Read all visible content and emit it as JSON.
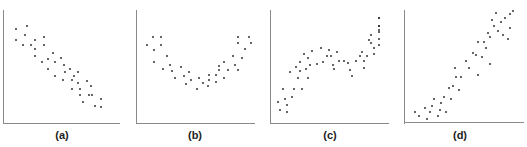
{
  "chart_data": [
    {
      "type": "scatter",
      "title": "(a)",
      "description": "negative linear correlation",
      "xlim": [
        0,
        100
      ],
      "ylim": [
        0,
        100
      ],
      "grid": false,
      "points": [
        [
          10,
          85
        ],
        [
          20,
          88
        ],
        [
          18,
          80
        ],
        [
          10,
          75
        ],
        [
          16,
          70
        ],
        [
          23,
          70
        ],
        [
          27,
          75
        ],
        [
          27,
          67
        ],
        [
          35,
          78
        ],
        [
          35,
          70
        ],
        [
          27,
          60
        ],
        [
          33,
          55
        ],
        [
          38,
          57
        ],
        [
          43,
          63
        ],
        [
          45,
          55
        ],
        [
          50,
          58
        ],
        [
          38,
          48
        ],
        [
          45,
          42
        ],
        [
          53,
          52
        ],
        [
          54,
          45
        ],
        [
          58,
          48
        ],
        [
          62,
          42
        ],
        [
          52,
          38
        ],
        [
          60,
          38
        ],
        [
          65,
          45
        ],
        [
          65,
          35
        ],
        [
          60,
          30
        ],
        [
          67,
          30
        ],
        [
          73,
          37
        ],
        [
          77,
          32
        ],
        [
          67,
          24
        ],
        [
          75,
          24
        ],
        [
          70,
          18
        ],
        [
          78,
          24
        ],
        [
          86,
          20
        ],
        [
          80,
          14
        ],
        [
          86,
          13
        ]
      ]
    },
    {
      "type": "scatter",
      "title": "(b)",
      "description": "U-shaped (quadratic) relationship",
      "xlim": [
        0,
        100
      ],
      "ylim": [
        0,
        100
      ],
      "grid": false,
      "points": [
        [
          5,
          70
        ],
        [
          11,
          78
        ],
        [
          18,
          78
        ],
        [
          12,
          66
        ],
        [
          18,
          70
        ],
        [
          23,
          60
        ],
        [
          12,
          55
        ],
        [
          20,
          48
        ],
        [
          26,
          52
        ],
        [
          28,
          46
        ],
        [
          30,
          40
        ],
        [
          36,
          50
        ],
        [
          38,
          42
        ],
        [
          40,
          34
        ],
        [
          43,
          45
        ],
        [
          45,
          38
        ],
        [
          50,
          30
        ],
        [
          52,
          40
        ],
        [
          55,
          35
        ],
        [
          60,
          32
        ],
        [
          61,
          43
        ],
        [
          61,
          38
        ],
        [
          67,
          43
        ],
        [
          67,
          36
        ],
        [
          70,
          51
        ],
        [
          70,
          47
        ],
        [
          74,
          55
        ],
        [
          74,
          40
        ],
        [
          78,
          47
        ],
        [
          82,
          60
        ],
        [
          84,
          52
        ],
        [
          87,
          47
        ],
        [
          87,
          72
        ],
        [
          87,
          78
        ],
        [
          90,
          58
        ],
        [
          93,
          67
        ],
        [
          96,
          78
        ],
        [
          98,
          72
        ]
      ]
    },
    {
      "type": "scatter",
      "title": "(c)",
      "description": "non-linear increasing wave relationship",
      "xlim": [
        0,
        100
      ],
      "ylim": [
        0,
        100
      ],
      "grid": false,
      "points": [
        [
          3,
          18
        ],
        [
          5,
          10
        ],
        [
          8,
          30
        ],
        [
          10,
          20
        ],
        [
          12,
          15
        ],
        [
          12,
          8
        ],
        [
          14,
          45
        ],
        [
          16,
          22
        ],
        [
          18,
          30
        ],
        [
          20,
          50
        ],
        [
          22,
          40
        ],
        [
          24,
          55
        ],
        [
          24,
          46
        ],
        [
          26,
          30
        ],
        [
          28,
          62
        ],
        [
          30,
          48
        ],
        [
          32,
          58
        ],
        [
          32,
          40
        ],
        [
          34,
          52
        ],
        [
          36,
          65
        ],
        [
          40,
          53
        ],
        [
          44,
          68
        ],
        [
          46,
          55
        ],
        [
          50,
          60
        ],
        [
          52,
          66
        ],
        [
          54,
          60
        ],
        [
          56,
          52
        ],
        [
          57,
          48
        ],
        [
          60,
          64
        ],
        [
          62,
          56
        ],
        [
          66,
          56
        ],
        [
          70,
          54
        ],
        [
          72,
          47
        ],
        [
          74,
          42
        ],
        [
          78,
          56
        ],
        [
          82,
          60
        ],
        [
          84,
          64
        ],
        [
          86,
          49
        ],
        [
          86,
          56
        ],
        [
          88,
          60
        ],
        [
          90,
          75
        ],
        [
          92,
          80
        ],
        [
          92,
          72
        ],
        [
          95,
          68
        ],
        [
          95,
          62
        ],
        [
          100,
          88
        ],
        [
          100,
          82
        ],
        [
          103,
          76
        ],
        [
          103,
          70
        ],
        [
          106,
          95
        ],
        [
          108,
          84
        ],
        [
          110,
          95
        ],
        [
          112,
          88
        ]
      ]
    },
    {
      "type": "scatter",
      "title": "(d)",
      "description": "positive non-linear (exponential/curved) relationship",
      "xlim": [
        0,
        100
      ],
      "ylim": [
        0,
        100
      ],
      "grid": false,
      "points": [
        [
          6,
          8
        ],
        [
          10,
          5
        ],
        [
          15,
          12
        ],
        [
          17,
          2
        ],
        [
          20,
          8
        ],
        [
          22,
          14
        ],
        [
          24,
          20
        ],
        [
          28,
          5
        ],
        [
          30,
          10
        ],
        [
          31,
          16
        ],
        [
          34,
          22
        ],
        [
          36,
          8
        ],
        [
          38,
          30
        ],
        [
          40,
          20
        ],
        [
          42,
          32
        ],
        [
          44,
          48
        ],
        [
          45,
          40
        ],
        [
          48,
          28
        ],
        [
          50,
          40
        ],
        [
          55,
          55
        ],
        [
          58,
          48
        ],
        [
          62,
          62
        ],
        [
          64,
          60
        ],
        [
          66,
          72
        ],
        [
          66,
          42
        ],
        [
          70,
          58
        ],
        [
          72,
          72
        ],
        [
          74,
          66
        ],
        [
          76,
          80
        ],
        [
          78,
          52
        ],
        [
          78,
          76
        ],
        [
          80,
          92
        ],
        [
          82,
          86
        ],
        [
          84,
          98
        ],
        [
          86,
          82
        ],
        [
          88,
          90
        ],
        [
          90,
          78
        ],
        [
          92,
          94
        ],
        [
          95,
          75
        ],
        [
          97,
          97
        ],
        [
          97,
          85
        ],
        [
          100,
          100
        ]
      ]
    }
  ],
  "labels": [
    "(a)",
    "(b)",
    "(c)",
    "(d)"
  ]
}
